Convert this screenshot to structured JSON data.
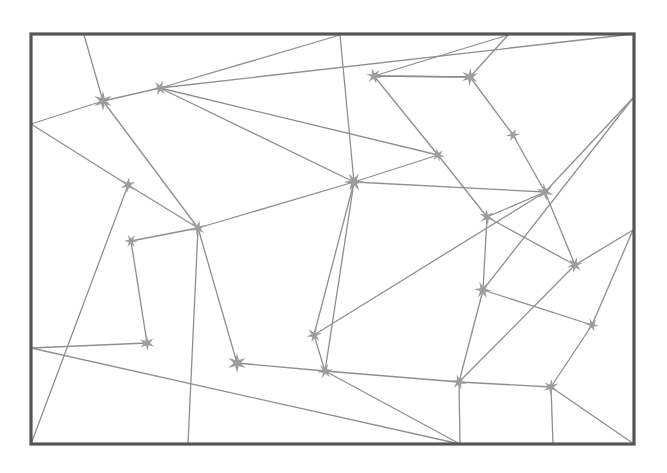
{
  "canvas": {
    "width": 667,
    "height": 473,
    "background": "#ffffff"
  },
  "frame": {
    "label": "outer-rectangle-border",
    "x": 31,
    "y": 34,
    "width": 603,
    "height": 410,
    "stroke": "#555555",
    "stroke_width": 3.2
  },
  "style": {
    "edge_stroke": "#8f8f8f",
    "edge_stroke_width": 1.3,
    "star_fill": "#9d9d9d",
    "star_points": 6,
    "star_outer_radius": 9,
    "star_inner_radius": 3.1
  },
  "nodes": [
    {
      "id": "s1",
      "name": "star-1",
      "x": 103,
      "y": 101,
      "r": 10
    },
    {
      "id": "s2",
      "name": "star-2",
      "x": 160,
      "y": 88,
      "r": 8
    },
    {
      "id": "s3",
      "name": "star-3",
      "x": 374,
      "y": 76,
      "r": 8
    },
    {
      "id": "s4",
      "name": "star-4",
      "x": 470,
      "y": 77,
      "r": 9
    },
    {
      "id": "s5",
      "name": "star-5",
      "x": 513,
      "y": 135,
      "r": 7
    },
    {
      "id": "s6",
      "name": "star-6",
      "x": 438,
      "y": 155,
      "r": 7
    },
    {
      "id": "s7",
      "name": "star-7",
      "x": 128,
      "y": 185,
      "r": 8
    },
    {
      "id": "s8",
      "name": "star-8",
      "x": 354,
      "y": 182,
      "r": 10
    },
    {
      "id": "s9",
      "name": "star-9",
      "x": 545,
      "y": 192,
      "r": 9
    },
    {
      "id": "s10",
      "name": "star-10",
      "x": 198,
      "y": 228,
      "r": 8
    },
    {
      "id": "s11",
      "name": "star-11",
      "x": 131,
      "y": 241,
      "r": 7
    },
    {
      "id": "s12",
      "name": "star-12",
      "x": 487,
      "y": 217,
      "r": 8
    },
    {
      "id": "s13",
      "name": "star-13",
      "x": 575,
      "y": 265,
      "r": 8
    },
    {
      "id": "s14",
      "name": "star-14",
      "x": 483,
      "y": 290,
      "r": 9
    },
    {
      "id": "s15",
      "name": "star-15",
      "x": 147,
      "y": 343,
      "r": 8
    },
    {
      "id": "s16",
      "name": "star-16",
      "x": 314,
      "y": 335,
      "r": 8
    },
    {
      "id": "s17",
      "name": "star-17",
      "x": 592,
      "y": 325,
      "r": 7
    },
    {
      "id": "s18",
      "name": "star-18",
      "x": 237,
      "y": 363,
      "r": 10
    },
    {
      "id": "s19",
      "name": "star-19",
      "x": 325,
      "y": 371,
      "r": 8
    },
    {
      "id": "s20",
      "name": "star-20",
      "x": 459,
      "y": 382,
      "r": 8
    },
    {
      "id": "s21",
      "name": "star-21",
      "x": 551,
      "y": 387,
      "r": 8
    }
  ],
  "anchors": [
    {
      "id": "aTL",
      "name": "anchor-top-left-corner",
      "x": 31,
      "y": 34
    },
    {
      "id": "aT1",
      "name": "anchor-top-edge-1",
      "x": 84,
      "y": 35
    },
    {
      "id": "aT2",
      "name": "anchor-top-edge-2",
      "x": 340,
      "y": 35
    },
    {
      "id": "aT3",
      "name": "anchor-top-edge-3",
      "x": 508,
      "y": 35
    },
    {
      "id": "aTR",
      "name": "anchor-top-right-corner",
      "x": 633,
      "y": 34
    },
    {
      "id": "aL1",
      "name": "anchor-left-edge-1",
      "x": 31,
      "y": 124
    },
    {
      "id": "aL2",
      "name": "anchor-left-edge-2",
      "x": 31,
      "y": 348
    },
    {
      "id": "aR1",
      "name": "anchor-right-edge-1",
      "x": 633,
      "y": 98
    },
    {
      "id": "aR2",
      "name": "anchor-right-edge-2",
      "x": 633,
      "y": 230
    },
    {
      "id": "aBL",
      "name": "anchor-bottom-left-corner",
      "x": 31,
      "y": 444
    },
    {
      "id": "aB1",
      "name": "anchor-bottom-edge-1",
      "x": 188,
      "y": 444
    },
    {
      "id": "aB2",
      "name": "anchor-bottom-edge-2",
      "x": 460,
      "y": 444
    },
    {
      "id": "aB3",
      "name": "anchor-bottom-edge-3",
      "x": 553,
      "y": 444
    },
    {
      "id": "aBR",
      "name": "anchor-bottom-right-corner",
      "x": 634,
      "y": 444
    }
  ],
  "edges": [
    {
      "from": "aT1",
      "to": "s1"
    },
    {
      "from": "s1",
      "to": "s10"
    },
    {
      "from": "aL1",
      "to": "s1"
    },
    {
      "from": "s1",
      "to": "s2"
    },
    {
      "from": "s2",
      "to": "s8"
    },
    {
      "from": "s2",
      "to": "aTR"
    },
    {
      "from": "s2",
      "to": "s6"
    },
    {
      "from": "aT2",
      "to": "s2"
    },
    {
      "from": "aT2",
      "to": "s8"
    },
    {
      "from": "s3",
      "to": "s6"
    },
    {
      "from": "s3",
      "to": "aT3"
    },
    {
      "from": "s3",
      "to": "s4"
    },
    {
      "from": "s4",
      "to": "s3"
    },
    {
      "from": "s4",
      "to": "s5"
    },
    {
      "from": "aT3",
      "to": "s4"
    },
    {
      "from": "s5",
      "to": "s9"
    },
    {
      "from": "s6",
      "to": "s8"
    },
    {
      "from": "s6",
      "to": "s12"
    },
    {
      "from": "aL1",
      "to": "s7"
    },
    {
      "from": "s7",
      "to": "s10"
    },
    {
      "from": "s7",
      "to": "aBL"
    },
    {
      "from": "s8",
      "to": "s10"
    },
    {
      "from": "s8",
      "to": "s9"
    },
    {
      "from": "s8",
      "to": "s16"
    },
    {
      "from": "s8",
      "to": "s19"
    },
    {
      "from": "s9",
      "to": "s12"
    },
    {
      "from": "s9",
      "to": "aR1"
    },
    {
      "from": "s9",
      "to": "s13"
    },
    {
      "from": "s10",
      "to": "s11"
    },
    {
      "from": "s10",
      "to": "aB1"
    },
    {
      "from": "s10",
      "to": "s18"
    },
    {
      "from": "s11",
      "to": "s15"
    },
    {
      "from": "s12",
      "to": "s14"
    },
    {
      "from": "s12",
      "to": "s13"
    },
    {
      "from": "aR1",
      "to": "s14"
    },
    {
      "from": "s13",
      "to": "aR2"
    },
    {
      "from": "s13",
      "to": "s20"
    },
    {
      "from": "s14",
      "to": "s20"
    },
    {
      "from": "s14",
      "to": "s17"
    },
    {
      "from": "aL2",
      "to": "s15"
    },
    {
      "from": "aL2",
      "to": "aB2"
    },
    {
      "from": "s16",
      "to": "s19"
    },
    {
      "from": "s16",
      "to": "s9"
    },
    {
      "from": "s17",
      "to": "aR2"
    },
    {
      "from": "s17",
      "to": "s21"
    },
    {
      "from": "s18",
      "to": "s19"
    },
    {
      "from": "s19",
      "to": "s20"
    },
    {
      "from": "s19",
      "to": "aB2"
    },
    {
      "from": "s20",
      "to": "aB2"
    },
    {
      "from": "s21",
      "to": "aB3"
    },
    {
      "from": "s21",
      "to": "aBR"
    },
    {
      "from": "s21",
      "to": "s20"
    }
  ]
}
